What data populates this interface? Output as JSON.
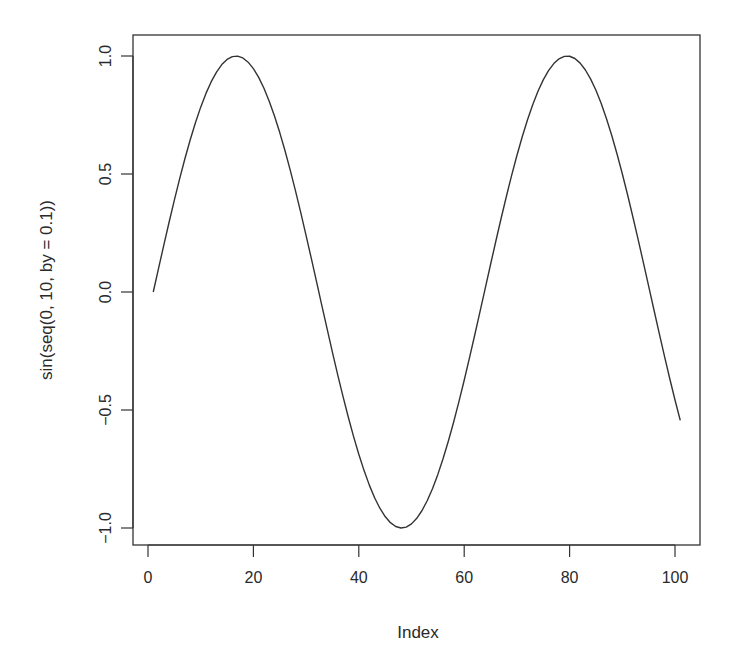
{
  "chart_data": {
    "type": "line",
    "title": "",
    "xlabel": "Index",
    "ylabel": "sin(seq(0, 10, by = 0.1))",
    "xlim": [
      0,
      101
    ],
    "ylim": [
      -1,
      1
    ],
    "grid": false,
    "legend": null,
    "x_ticks": [
      0,
      20,
      40,
      60,
      80,
      100
    ],
    "x_tick_labels": [
      "0",
      "20",
      "40",
      "60",
      "80",
      "100"
    ],
    "y_ticks": [
      -1.0,
      -0.5,
      0.0,
      0.5,
      1.0
    ],
    "y_tick_labels": [
      "−1.0",
      "−0.5",
      "0.0",
      "0.5",
      "1.0"
    ],
    "series": [
      {
        "name": "sin(seq(0, 10, by = 0.1))",
        "x_start": 1,
        "x_end": 101,
        "color": "#333333",
        "values": [
          0.0,
          0.0998,
          0.1987,
          0.2955,
          0.3894,
          0.4794,
          0.5646,
          0.6442,
          0.7174,
          0.7833,
          0.8415,
          0.8912,
          0.932,
          0.9636,
          0.9854,
          0.9975,
          0.9996,
          0.9917,
          0.9738,
          0.9463,
          0.9093,
          0.8632,
          0.8085,
          0.7457,
          0.6755,
          0.5985,
          0.5155,
          0.4274,
          0.335,
          0.2392,
          0.1411,
          0.0416,
          -0.0584,
          -0.1577,
          -0.2555,
          -0.3508,
          -0.4425,
          -0.5298,
          -0.6119,
          -0.6878,
          -0.7568,
          -0.8183,
          -0.8716,
          -0.9162,
          -0.9516,
          -0.9775,
          -0.9937,
          -0.9999,
          -0.9962,
          -0.9825,
          -0.9589,
          -0.9258,
          -0.8835,
          -0.8323,
          -0.7728,
          -0.7055,
          -0.6313,
          -0.5507,
          -0.4646,
          -0.3739,
          -0.2794,
          -0.1822,
          -0.0831,
          0.0168,
          0.1165,
          0.2151,
          0.3115,
          0.4048,
          0.4941,
          0.5784,
          0.657,
          0.729,
          0.7937,
          0.8504,
          0.8987,
          0.938,
          0.9679,
          0.9882,
          0.9985,
          0.9989,
          0.9894,
          0.9699,
          0.9407,
          0.9022,
          0.8546,
          0.7985,
          0.7344,
          0.663,
          0.585,
          0.501,
          0.4121,
          0.319,
          0.2229,
          0.1245,
          0.0248,
          -0.0752,
          -0.1743,
          -0.2718,
          -0.3665,
          -0.4575,
          -0.544
        ]
      }
    ]
  },
  "colors": {
    "line": "#333333",
    "axis": "#333333",
    "text": "#2a2a2a",
    "background": "#ffffff"
  }
}
